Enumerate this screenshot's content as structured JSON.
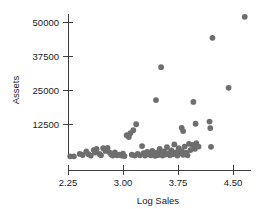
{
  "chart_data": {
    "type": "scatter",
    "title": "",
    "xlabel": "Log Sales",
    "ylabel": "Assets",
    "xlim": [
      2.1,
      4.85
    ],
    "ylim": [
      0,
      54000
    ],
    "grid": false,
    "legend": null,
    "marker_color": "#6e6e6e",
    "axis_color": "#3d3d3d",
    "xticks": [
      {
        "value": 2.25,
        "label": "2.25"
      },
      {
        "value": 3.0,
        "label": "3.00"
      },
      {
        "value": 3.75,
        "label": "3.75"
      },
      {
        "value": 4.5,
        "label": "4.50"
      }
    ],
    "yticks": [
      {
        "value": 12500,
        "label": "12500"
      },
      {
        "value": 25000,
        "label": "25000"
      },
      {
        "value": 37500,
        "label": "37500"
      },
      {
        "value": 50000,
        "label": "50000"
      }
    ],
    "points": [
      {
        "x": 2.28,
        "y": 600
      },
      {
        "x": 2.33,
        "y": 600
      },
      {
        "x": 2.41,
        "y": 1500
      },
      {
        "x": 2.45,
        "y": 1100
      },
      {
        "x": 2.5,
        "y": 2400
      },
      {
        "x": 2.53,
        "y": 1400
      },
      {
        "x": 2.56,
        "y": 900
      },
      {
        "x": 2.6,
        "y": 2900
      },
      {
        "x": 2.62,
        "y": 2000
      },
      {
        "x": 2.64,
        "y": 3300
      },
      {
        "x": 2.68,
        "y": 1500
      },
      {
        "x": 2.7,
        "y": 1000
      },
      {
        "x": 2.73,
        "y": 3600
      },
      {
        "x": 2.76,
        "y": 2600
      },
      {
        "x": 2.79,
        "y": 3700
      },
      {
        "x": 2.82,
        "y": 2000
      },
      {
        "x": 2.84,
        "y": 1300
      },
      {
        "x": 2.86,
        "y": 900
      },
      {
        "x": 2.89,
        "y": 2100
      },
      {
        "x": 2.92,
        "y": 1000
      },
      {
        "x": 2.95,
        "y": 1200
      },
      {
        "x": 2.98,
        "y": 900
      },
      {
        "x": 3.0,
        "y": 1600
      },
      {
        "x": 3.02,
        "y": 700
      },
      {
        "x": 3.05,
        "y": 8400
      },
      {
        "x": 3.08,
        "y": 7700
      },
      {
        "x": 3.1,
        "y": 9100
      },
      {
        "x": 3.14,
        "y": 10200
      },
      {
        "x": 3.18,
        "y": 12400
      },
      {
        "x": 3.12,
        "y": 1200
      },
      {
        "x": 3.16,
        "y": 900
      },
      {
        "x": 3.2,
        "y": 1500
      },
      {
        "x": 3.23,
        "y": 1000
      },
      {
        "x": 3.26,
        "y": 4400
      },
      {
        "x": 3.28,
        "y": 1800
      },
      {
        "x": 3.3,
        "y": 900
      },
      {
        "x": 3.33,
        "y": 2200
      },
      {
        "x": 3.35,
        "y": 1300
      },
      {
        "x": 3.38,
        "y": 1000
      },
      {
        "x": 3.4,
        "y": 2600
      },
      {
        "x": 3.42,
        "y": 1500
      },
      {
        "x": 3.44,
        "y": 800
      },
      {
        "x": 3.46,
        "y": 2000
      },
      {
        "x": 3.48,
        "y": 1100
      },
      {
        "x": 3.5,
        "y": 3300
      },
      {
        "x": 3.52,
        "y": 1600
      },
      {
        "x": 3.54,
        "y": 900
      },
      {
        "x": 3.56,
        "y": 2400
      },
      {
        "x": 3.58,
        "y": 1300
      },
      {
        "x": 3.6,
        "y": 4000
      },
      {
        "x": 3.62,
        "y": 1800
      },
      {
        "x": 3.64,
        "y": 1000
      },
      {
        "x": 3.66,
        "y": 2800
      },
      {
        "x": 3.68,
        "y": 1400
      },
      {
        "x": 3.7,
        "y": 5000
      },
      {
        "x": 3.72,
        "y": 2100
      },
      {
        "x": 3.74,
        "y": 900
      },
      {
        "x": 3.76,
        "y": 3600
      },
      {
        "x": 3.78,
        "y": 1700
      },
      {
        "x": 3.8,
        "y": 2500
      },
      {
        "x": 3.82,
        "y": 1200
      },
      {
        "x": 3.84,
        "y": 4200
      },
      {
        "x": 3.86,
        "y": 2000
      },
      {
        "x": 3.88,
        "y": 1000
      },
      {
        "x": 3.9,
        "y": 5200
      },
      {
        "x": 3.92,
        "y": 2900
      },
      {
        "x": 3.95,
        "y": 4800
      },
      {
        "x": 3.98,
        "y": 3400
      },
      {
        "x": 4.0,
        "y": 5500
      },
      {
        "x": 4.03,
        "y": 4200
      },
      {
        "x": 3.45,
        "y": 21300
      },
      {
        "x": 3.52,
        "y": 33400
      },
      {
        "x": 3.8,
        "y": 11100
      },
      {
        "x": 3.82,
        "y": 9900
      },
      {
        "x": 3.96,
        "y": 20600
      },
      {
        "x": 3.99,
        "y": 12600
      },
      {
        "x": 4.18,
        "y": 13400
      },
      {
        "x": 4.19,
        "y": 11000
      },
      {
        "x": 4.2,
        "y": 4100
      },
      {
        "x": 4.22,
        "y": 44200
      },
      {
        "x": 4.44,
        "y": 25800
      },
      {
        "x": 4.66,
        "y": 51900
      }
    ]
  }
}
